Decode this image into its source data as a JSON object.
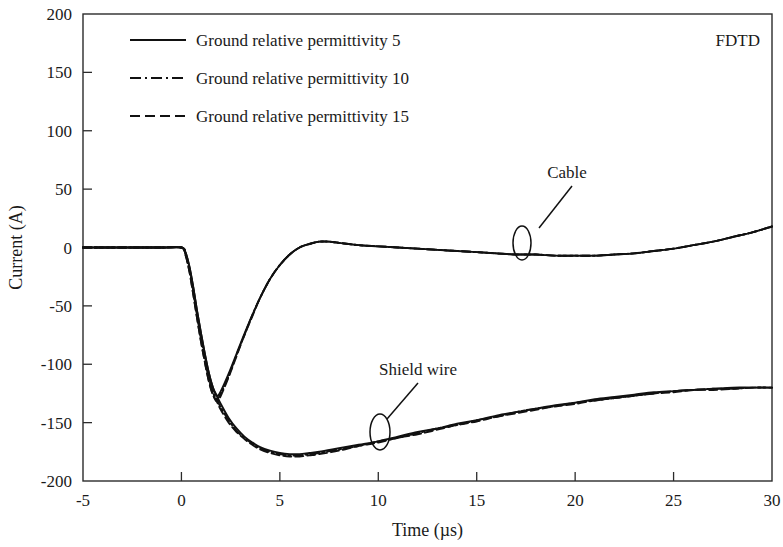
{
  "chart_data": {
    "type": "line",
    "title": "",
    "corner_label": "FDTD",
    "xlabel": "Time (µs)",
    "ylabel": "Current (A)",
    "xlim": [
      -5,
      30
    ],
    "ylim": [
      -200,
      200
    ],
    "xticks": [
      -5,
      0,
      5,
      10,
      15,
      20,
      25,
      30
    ],
    "xtick_labels": [
      "-5",
      "0",
      "5",
      "10",
      "15",
      "20",
      "25",
      "30"
    ],
    "yticks": [
      -200,
      -150,
      -100,
      -50,
      0,
      50,
      100,
      150,
      200
    ],
    "ytick_labels": [
      "-200",
      "-150",
      "-100",
      "-50",
      "0",
      "50",
      "100",
      "150",
      "200"
    ],
    "grid": false,
    "legend_position": "upper-left",
    "legend": [
      {
        "label": "Ground relative permittivity 5",
        "style": "solid"
      },
      {
        "label": "Ground relative permittivity 10",
        "style": "dash-dot"
      },
      {
        "label": "Ground relative permittivity 15",
        "style": "dashed"
      }
    ],
    "annotations": [
      {
        "label": "Cable",
        "point_x": 17.3,
        "point_y": -2
      },
      {
        "label": "Shield wire",
        "point_x": 10.1,
        "point_y": -158
      }
    ],
    "series": [
      {
        "name": "Cable - Ground relative permittivity 5",
        "group": "Cable",
        "style": "solid",
        "x": [
          -5,
          -3,
          -1,
          0,
          0.2,
          0.4,
          0.6,
          0.8,
          1.0,
          1.2,
          1.4,
          1.6,
          1.8,
          2.0,
          2.4,
          2.8,
          3.2,
          3.6,
          4.0,
          4.5,
          5.0,
          5.5,
          6.0,
          6.5,
          7.0,
          7.5,
          8.0,
          9.0,
          10.0,
          11.0,
          12.0,
          13.0,
          14.0,
          15.0,
          16.0,
          17.0,
          18.0,
          19.0,
          20.0,
          21.0,
          22.0,
          23.0,
          24.0,
          25.0,
          26.0,
          27.0,
          28.0,
          29.0,
          30.0
        ],
        "y": [
          0,
          0,
          0,
          0,
          -4,
          -16,
          -34,
          -55,
          -74,
          -92,
          -108,
          -120,
          -127,
          -123,
          -108,
          -91,
          -74,
          -58,
          -43,
          -27,
          -15,
          -6,
          0,
          3,
          5,
          5,
          4,
          2,
          1,
          0,
          -1,
          -2,
          -3,
          -4,
          -5,
          -6,
          -6,
          -7,
          -7,
          -7,
          -6,
          -5,
          -3,
          -1,
          2,
          5,
          9,
          13,
          18
        ]
      },
      {
        "name": "Cable - Ground relative permittivity 10",
        "group": "Cable",
        "style": "dash-dot",
        "x": [
          -5,
          -3,
          -1,
          0,
          0.2,
          0.4,
          0.6,
          0.8,
          1.0,
          1.2,
          1.4,
          1.6,
          1.8,
          2.0,
          2.4,
          2.8,
          3.2,
          3.6,
          4.0,
          4.5,
          5.0,
          5.5,
          6.0,
          6.5,
          7.0,
          7.5,
          8.0,
          9.0,
          10.0,
          11.0,
          12.0,
          13.0,
          14.0,
          15.0,
          16.0,
          17.0,
          18.0,
          19.0,
          20.0,
          21.0,
          22.0,
          23.0,
          24.0,
          25.0,
          26.0,
          27.0,
          28.0,
          29.0,
          30.0
        ],
        "y": [
          0,
          0,
          0,
          0,
          -5,
          -18,
          -37,
          -58,
          -78,
          -96,
          -112,
          -124,
          -130,
          -125,
          -110,
          -92,
          -75,
          -58,
          -43,
          -27,
          -15,
          -6,
          0,
          3,
          5,
          5,
          4,
          2,
          1,
          0,
          -1,
          -2,
          -3,
          -4,
          -5,
          -6,
          -6,
          -7,
          -7,
          -7,
          -6,
          -5,
          -3,
          -1,
          2,
          5,
          9,
          13,
          18
        ]
      },
      {
        "name": "Cable - Ground relative permittivity 15",
        "group": "Cable",
        "style": "dashed",
        "x": [
          -5,
          -3,
          -1,
          0,
          0.2,
          0.4,
          0.6,
          0.8,
          1.0,
          1.2,
          1.4,
          1.6,
          1.8,
          2.0,
          2.4,
          2.8,
          3.2,
          3.6,
          4.0,
          4.5,
          5.0,
          5.5,
          6.0,
          6.5,
          7.0,
          7.5,
          8.0,
          9.0,
          10.0,
          11.0,
          12.0,
          13.0,
          14.0,
          15.0,
          16.0,
          17.0,
          18.0,
          19.0,
          20.0,
          21.0,
          22.0,
          23.0,
          24.0,
          25.0,
          26.0,
          27.0,
          28.0,
          29.0,
          30.0
        ],
        "y": [
          0,
          0,
          0,
          0,
          -6,
          -20,
          -40,
          -61,
          -81,
          -99,
          -115,
          -126,
          -132,
          -127,
          -111,
          -93,
          -75,
          -59,
          -43,
          -27,
          -15,
          -6,
          0,
          3,
          5,
          5,
          4,
          2,
          1,
          0,
          -1,
          -2,
          -3,
          -4,
          -5,
          -6,
          -6,
          -7,
          -7,
          -7,
          -6,
          -5,
          -3,
          -1,
          2,
          5,
          9,
          13,
          18
        ]
      },
      {
        "name": "Shield wire - Ground relative permittivity 5",
        "group": "Shield wire",
        "style": "solid",
        "x": [
          -5,
          -3,
          -1,
          0,
          0.2,
          0.4,
          0.6,
          0.8,
          1.0,
          1.2,
          1.4,
          1.6,
          1.8,
          2.0,
          2.4,
          2.8,
          3.2,
          3.6,
          4.0,
          4.5,
          5.0,
          5.5,
          6.0,
          6.5,
          7.0,
          8.0,
          9.0,
          10.0,
          11.0,
          12.0,
          13.0,
          14.0,
          15.0,
          16.0,
          17.0,
          18.0,
          19.0,
          20.0,
          21.0,
          22.0,
          23.0,
          24.0,
          25.0,
          26.0,
          27.0,
          28.0,
          29.0,
          30.0
        ],
        "y": [
          0,
          0,
          0,
          0,
          -4,
          -16,
          -34,
          -55,
          -74,
          -92,
          -108,
          -120,
          -127,
          -134,
          -146,
          -155,
          -162,
          -167,
          -171,
          -174,
          -176,
          -177,
          -177,
          -176,
          -175,
          -172,
          -169,
          -166,
          -162,
          -158,
          -155,
          -151,
          -148,
          -144,
          -141,
          -138,
          -135,
          -133,
          -130,
          -128,
          -126,
          -124,
          -123,
          -122,
          -121,
          -120,
          -120,
          -120
        ]
      },
      {
        "name": "Shield wire - Ground relative permittivity 10",
        "group": "Shield wire",
        "style": "dash-dot",
        "x": [
          -5,
          -3,
          -1,
          0,
          0.2,
          0.4,
          0.6,
          0.8,
          1.0,
          1.2,
          1.4,
          1.6,
          1.8,
          2.0,
          2.4,
          2.8,
          3.2,
          3.6,
          4.0,
          4.5,
          5.0,
          5.5,
          6.0,
          6.5,
          7.0,
          8.0,
          9.0,
          10.0,
          11.0,
          12.0,
          13.0,
          14.0,
          15.0,
          16.0,
          17.0,
          18.0,
          19.0,
          20.0,
          21.0,
          22.0,
          23.0,
          24.0,
          25.0,
          26.0,
          27.0,
          28.0,
          29.0,
          30.0
        ],
        "y": [
          0,
          0,
          0,
          0,
          -5,
          -18,
          -37,
          -58,
          -78,
          -96,
          -112,
          -124,
          -130,
          -137,
          -148,
          -157,
          -163,
          -168,
          -172,
          -175,
          -177,
          -178,
          -178,
          -177,
          -176,
          -173,
          -170,
          -166,
          -163,
          -159,
          -155,
          -152,
          -148,
          -145,
          -141,
          -138,
          -136,
          -133,
          -131,
          -129,
          -127,
          -125,
          -123,
          -122,
          -121,
          -121,
          -120,
          -120
        ]
      },
      {
        "name": "Shield wire - Ground relative permittivity 15",
        "group": "Shield wire",
        "style": "dashed",
        "x": [
          -5,
          -3,
          -1,
          0,
          0.2,
          0.4,
          0.6,
          0.8,
          1.0,
          1.2,
          1.4,
          1.6,
          1.8,
          2.0,
          2.4,
          2.8,
          3.2,
          3.6,
          4.0,
          4.5,
          5.0,
          5.5,
          6.0,
          6.5,
          7.0,
          8.0,
          9.0,
          10.0,
          11.0,
          12.0,
          13.0,
          14.0,
          15.0,
          16.0,
          17.0,
          18.0,
          19.0,
          20.0,
          21.0,
          22.0,
          23.0,
          24.0,
          25.0,
          26.0,
          27.0,
          28.0,
          29.0,
          30.0
        ],
        "y": [
          0,
          0,
          0,
          0,
          -6,
          -20,
          -40,
          -61,
          -81,
          -99,
          -115,
          -126,
          -132,
          -139,
          -150,
          -158,
          -164,
          -169,
          -173,
          -176,
          -178,
          -179,
          -179,
          -178,
          -177,
          -174,
          -170,
          -167,
          -163,
          -160,
          -156,
          -152,
          -149,
          -145,
          -142,
          -139,
          -136,
          -134,
          -131,
          -129,
          -127,
          -125,
          -124,
          -122,
          -122,
          -121,
          -120,
          -120
        ]
      }
    ]
  }
}
